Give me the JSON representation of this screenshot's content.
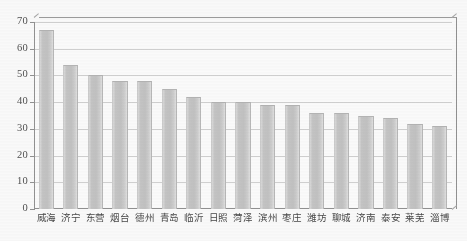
{
  "chart_data": {
    "type": "bar",
    "title": "",
    "subtitle": "",
    "xlabel": "",
    "ylabel": "",
    "ylim": [
      0,
      70
    ],
    "ytick_step": 10,
    "yticks": [
      0,
      10,
      20,
      30,
      40,
      50,
      60,
      70
    ],
    "ytick_labels": [
      "0",
      "10",
      "20",
      "30",
      "40",
      "50",
      "60",
      "70"
    ],
    "grid": true,
    "grid_axis": "y",
    "legend": false,
    "legend_position": "none",
    "categories": [
      "威海",
      "济宁",
      "东营",
      "烟台",
      "德州",
      "青岛",
      "临沂",
      "日照",
      "菏泽",
      "滨州",
      "枣庄",
      "潍坊",
      "聊城",
      "济南",
      "泰安",
      "莱芜",
      "淄博"
    ],
    "values": [
      67,
      54,
      50,
      48,
      48,
      45,
      42,
      40,
      40,
      39,
      39,
      36,
      36,
      35,
      34,
      32,
      31
    ],
    "series": [
      {
        "name": "",
        "values": [
          67,
          54,
          50,
          48,
          48,
          45,
          42,
          40,
          40,
          39,
          39,
          36,
          36,
          35,
          34,
          32,
          31
        ]
      }
    ],
    "bar_color": "#c6c6c6",
    "bar_edge_color": "#b4b4b4",
    "grid_color": "#d2d2d2",
    "axis_color": "#8f8f8f",
    "background_color": "#ffffff",
    "text_color": "#3f3f3f"
  }
}
